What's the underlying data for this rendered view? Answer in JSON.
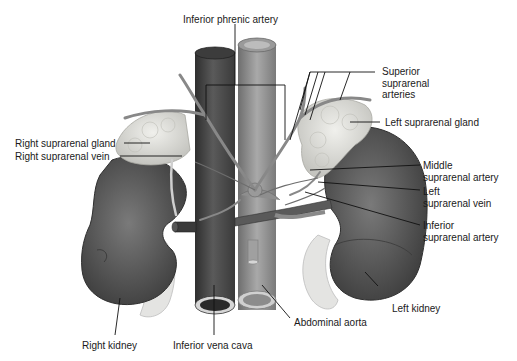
{
  "diagram": {
    "type": "anatomical-illustration",
    "colors": {
      "background": "#ffffff",
      "vena_cava": "#4a4a4a",
      "aorta": "#8a8a8a",
      "kidney": "#5c5c5c",
      "gland": "#d9d9d4",
      "ureter": "#e6e6e6",
      "leader_line": "#111111",
      "label_text": "#1a1a1a"
    },
    "labels": {
      "inferior_phrenic_artery": "Inferior phrenic artery",
      "superior_suprarenal_arteries": "Superior\nsuprarenal\narteries",
      "left_suprarenal_gland": "Left suprarenal gland",
      "right_suprarenal_gland": "Right suprarenal gland",
      "right_suprarenal_vein": "Right suprarenal vein",
      "middle_suprarenal_artery": "Middle\nsuprarenal artery",
      "left_suprarenal_vein": "Left\nsuprarenal vein",
      "inferior_suprarenal_artery": "Inferior\nsuprarenal artery",
      "left_kidney": "Left kidney",
      "abdominal_aorta": "Abdominal aorta",
      "right_kidney": "Right kidney",
      "inferior_vena_cava": "Inferior vena cava"
    }
  }
}
